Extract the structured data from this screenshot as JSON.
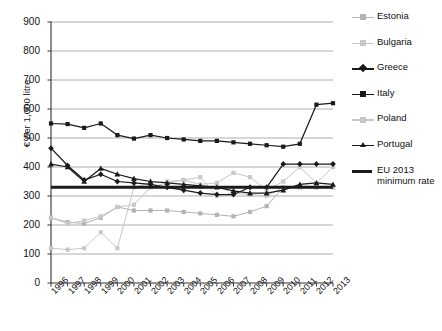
{
  "chart_data": {
    "type": "line",
    "title": "",
    "xlabel": "",
    "ylabel": "€ per 1,000 litre",
    "ylim": [
      0,
      900
    ],
    "ytick_step": 100,
    "yticks": [
      "0",
      "100",
      "200",
      "300",
      "400",
      "500",
      "600",
      "700",
      "800",
      "900"
    ],
    "grid": true,
    "legend_position": "right",
    "categories": [
      "1996",
      "1997",
      "1998",
      "1999",
      "2000",
      "2001",
      "2002",
      "2003",
      "2004",
      "2005",
      "2006",
      "2007",
      "2008",
      "2009",
      "2010",
      "2011",
      "2012",
      "2013"
    ],
    "series": [
      {
        "name": "Estonia",
        "color": "#b3b3b3",
        "marker": "square",
        "values": [
          225,
          210,
          205,
          225,
          262,
          250,
          250,
          250,
          245,
          240,
          235,
          230,
          245,
          265,
          330,
          330,
          330,
          330
        ]
      },
      {
        "name": "Bulgaria",
        "color": "#c8c8c8",
        "marker": "square",
        "values": [
          120,
          115,
          120,
          175,
          120,
          330,
          345,
          350,
          355,
          365,
          300,
          310,
          305,
          300,
          330,
          330,
          330,
          330
        ]
      },
      {
        "name": "Greece",
        "color": "#1a1a1a",
        "marker": "diamond",
        "values": [
          465,
          405,
          355,
          375,
          350,
          345,
          340,
          330,
          320,
          310,
          305,
          305,
          330,
          330,
          410,
          410,
          410,
          410
        ]
      },
      {
        "name": "Italy",
        "color": "#1a1a1a",
        "marker": "square",
        "values": [
          550,
          548,
          535,
          550,
          510,
          498,
          510,
          500,
          495,
          490,
          490,
          485,
          480,
          475,
          470,
          480,
          615,
          620
        ]
      },
      {
        "name": "Poland",
        "color": "#c8c8c8",
        "marker": "square",
        "values": [
          225,
          205,
          215,
          230,
          262,
          270,
          330,
          345,
          355,
          340,
          345,
          380,
          365,
          320,
          350,
          400,
          345,
          400
        ]
      },
      {
        "name": "Portugal",
        "color": "#1a1a1a",
        "marker": "triangle",
        "values": [
          410,
          400,
          350,
          395,
          375,
          360,
          350,
          345,
          340,
          335,
          330,
          318,
          310,
          310,
          320,
          340,
          345,
          340
        ]
      },
      {
        "name": "EU 2013 minimum rate",
        "color": "#1a1a1a",
        "marker": "none",
        "style": "thick-line",
        "constant": 330,
        "values": [
          330,
          330,
          330,
          330,
          330,
          330,
          330,
          330,
          330,
          330,
          330,
          330,
          330,
          330,
          330,
          330,
          330,
          330
        ]
      }
    ]
  },
  "legend": {
    "items": [
      {
        "label": "Estonia"
      },
      {
        "label": "Bulgaria"
      },
      {
        "label": "Greece"
      },
      {
        "label": "Italy"
      },
      {
        "label": "Poland"
      },
      {
        "label": "Portugal"
      },
      {
        "label": "EU 2013 minimum rate"
      }
    ]
  }
}
